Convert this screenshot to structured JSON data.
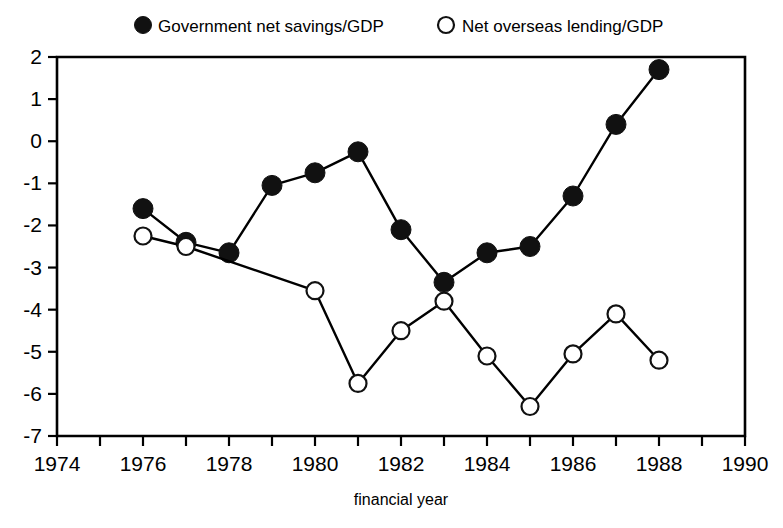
{
  "chart_data": {
    "type": "line",
    "title": "",
    "xlabel": "financial year",
    "ylabel": "",
    "xlim": [
      1974,
      1990
    ],
    "ylim": [
      -7,
      2
    ],
    "grid": false,
    "legend_position": "top",
    "x_tick_labels": [
      "1974",
      "1976",
      "1978",
      "1980",
      "1982",
      "1984",
      "1986",
      "1988",
      "1990"
    ],
    "x_tick_values": [
      1974,
      1976,
      1978,
      1980,
      1982,
      1984,
      1986,
      1988,
      1990
    ],
    "x_minor_ticks": [
      1975,
      1977,
      1979,
      1981,
      1983,
      1985,
      1987,
      1989
    ],
    "y_tick_labels": [
      "2",
      "1",
      "0",
      "-1",
      "-2",
      "-3",
      "-4",
      "-5",
      "-6",
      "-7"
    ],
    "y_tick_values": [
      2,
      1,
      0,
      -1,
      -2,
      -3,
      -4,
      -5,
      -6,
      -7
    ],
    "series": [
      {
        "name": "Government net savings/GDP",
        "marker": "filled-circle",
        "color": "#111111",
        "x": [
          1976,
          1977,
          1978,
          1979,
          1980,
          1981,
          1982,
          1983,
          1984,
          1985,
          1986,
          1987,
          1988
        ],
        "values": [
          -1.6,
          -2.4,
          -2.65,
          -1.05,
          -0.75,
          -0.25,
          -2.1,
          -3.35,
          -2.65,
          -2.5,
          -1.3,
          0.4,
          1.7
        ]
      },
      {
        "name": "Net overseas lending/GDP",
        "marker": "open-circle",
        "color": "#111111",
        "x": [
          1976,
          1977,
          1980,
          1981,
          1982,
          1983,
          1984,
          1985,
          1986,
          1987,
          1988
        ],
        "values": [
          -2.25,
          -2.5,
          -3.55,
          -5.75,
          -4.5,
          -3.8,
          -5.1,
          -6.3,
          -5.05,
          -4.1,
          -5.2
        ]
      }
    ]
  },
  "legend": {
    "entries": [
      {
        "label": "Government net savings/GDP",
        "marker": "filled-circle"
      },
      {
        "label": "Net overseas lending/GDP",
        "marker": "open-circle"
      }
    ]
  },
  "axes": {
    "x_title": "financial year"
  }
}
